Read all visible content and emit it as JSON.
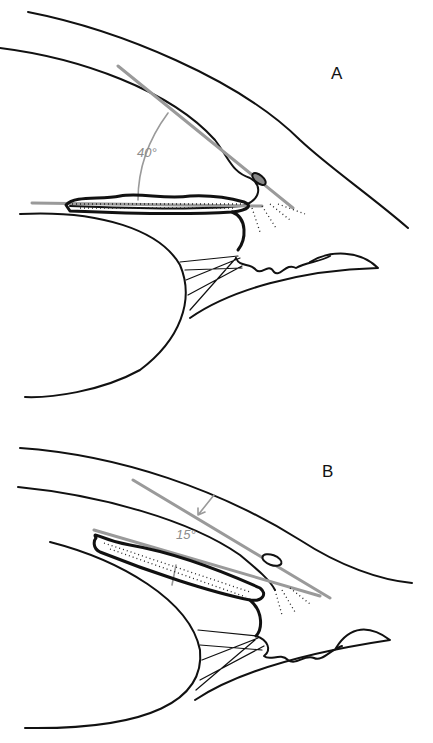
{
  "figure": {
    "panels": [
      {
        "id": "A",
        "label": "A",
        "angle_label": "40°",
        "angle_value_deg": 40,
        "angle_color": "#9a9a9a"
      },
      {
        "id": "B",
        "label": "B",
        "angle_label": "15°",
        "angle_value_deg": 15,
        "angle_color": "#9a9a9a"
      }
    ],
    "colors": {
      "ink": "#111111",
      "measurement_lines": "#9a9a9a",
      "background": "#ffffff"
    }
  }
}
